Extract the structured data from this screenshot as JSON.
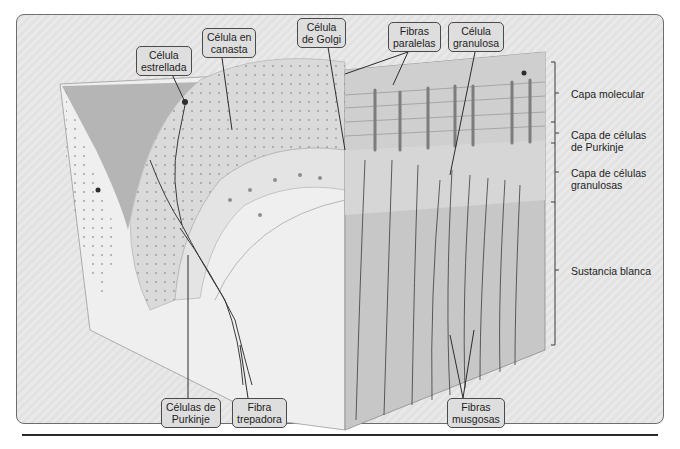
{
  "figure": {
    "callouts": {
      "stellate_cell": [
        "Célula",
        "estrellada"
      ],
      "basket_cell": [
        "Célula en",
        "canasta"
      ],
      "golgi_cell": [
        "Célula",
        "de Golgi"
      ],
      "parallel_fibers": [
        "Fibras",
        "paralelas"
      ],
      "granule_cell": [
        "Célula",
        "granulosa"
      ],
      "purkinje_cells": [
        "Células de",
        "Purkinje"
      ],
      "climbing_fiber": [
        "Fibra",
        "trepadora"
      ],
      "mossy_fibers": [
        "Fibras",
        "musgosas"
      ]
    },
    "layers": {
      "molecular": [
        "Capa molecular"
      ],
      "purkinje": [
        "Capa de células",
        "de Purkinje"
      ],
      "granular": [
        "Capa de células",
        "granulosas"
      ],
      "white_matter": [
        "Sustancia blanca"
      ]
    },
    "colors": {
      "frame_bg": "#e6e6e6",
      "block_face": "#c9c9c9",
      "molecular_layer": "#dcdcdc",
      "white_matter": "#f2f2f2",
      "fiber": "#3a3a3a"
    }
  }
}
